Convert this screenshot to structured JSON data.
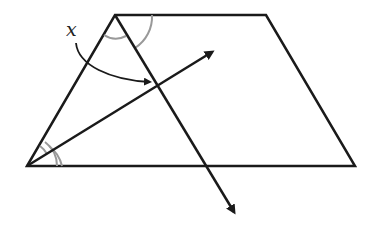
{
  "diagram": {
    "type": "geometry",
    "colors": {
      "stroke": "#1a1a1a",
      "arc": "#999999",
      "background": "#ffffff"
    },
    "vertices": {
      "top_left": [
        115,
        15
      ],
      "top_right": [
        266,
        15
      ],
      "bottom_right": [
        355,
        166
      ],
      "bottom_left": [
        27,
        166
      ]
    },
    "labels": {
      "angle_label": "x"
    }
  }
}
